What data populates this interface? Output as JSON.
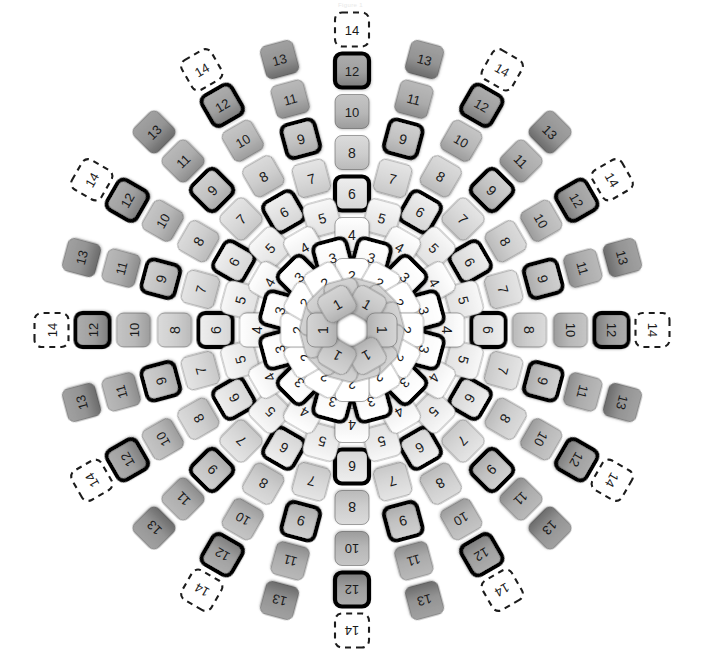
{
  "title": "Figure 1",
  "diagram": {
    "name": "radial-tile-mandala",
    "background": "#ffffff",
    "center": {
      "x": 352,
      "y": 330
    },
    "symmetry": 12,
    "ring_values": [
      1,
      2,
      3,
      4,
      5,
      6,
      7,
      8,
      9,
      10,
      11,
      12,
      13,
      14
    ],
    "max_value": 14,
    "dashed_value": 14,
    "highlight_values": [
      3,
      6,
      9,
      12
    ],
    "colors": {
      "background": "#ffffff",
      "tile_stroke": "#3a3a3a",
      "tile_text": "#1a1a1a",
      "highlight_stroke": "#000000",
      "dashed_stroke": "#1c1c1c",
      "fill_low": "#ffffff",
      "fill_high": "#9a9a9a",
      "center_tile_fill": "#8d8d8d"
    },
    "legend": {
      "solid_tile": "standard tile",
      "dashed_tile": "boundary tile",
      "bold_tile": "highlighted pair"
    },
    "geometry": {
      "tile_size": 34,
      "tile_corner_radius": 7,
      "ring_spacing": 20.5,
      "first_ring_radius": 34,
      "lane_offset_deg": 15
    },
    "labels": {
      "values": [
        "1",
        "2",
        "3",
        "4",
        "5",
        "6",
        "7",
        "8",
        "9",
        "10",
        "11",
        "12",
        "13",
        "14"
      ]
    }
  }
}
